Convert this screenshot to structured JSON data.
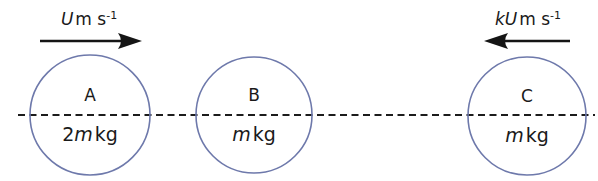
{
  "diagram": {
    "type": "physics-collision-diagram",
    "background_color": "#ffffff",
    "circle_stroke_color": "#6e79ab",
    "line_color": "#1c1c1c",
    "arrow_color": "#151515",
    "axis": {
      "style": "dashed",
      "y": 115,
      "x_start": 18,
      "x_end": 595
    },
    "bodies": [
      {
        "id": "A",
        "label": "A",
        "mass_prefix": "2",
        "mass_symbol": "m",
        "mass_unit": "kg",
        "mass_text": "2m kg",
        "cx": 90,
        "cy": 115,
        "r": 60
      },
      {
        "id": "B",
        "label": "B",
        "mass_prefix": "",
        "mass_symbol": "m",
        "mass_unit": "kg",
        "mass_text": "m kg",
        "cx": 254,
        "cy": 115,
        "r": 58
      },
      {
        "id": "C",
        "label": "C",
        "mass_prefix": "",
        "mass_symbol": "m",
        "mass_unit": "kg",
        "mass_text": "m kg",
        "cx": 527,
        "cy": 116,
        "r": 59
      }
    ],
    "velocity_arrows": [
      {
        "id": "velocity-A",
        "for_body": "A",
        "direction": "right",
        "symbol": "U",
        "unit": "m s",
        "exponent": "-1",
        "label_text": "U m s⁻¹",
        "label_x": 89,
        "label_y": 25,
        "shaft_y": 41,
        "shaft_x_start": 40,
        "shaft_x_end": 126,
        "tip_x": 142
      },
      {
        "id": "velocity-C",
        "for_body": "C",
        "direction": "left",
        "symbol": "kU",
        "unit": "m s",
        "exponent": "-1",
        "label_text": "kU m s⁻¹",
        "label_x": 528,
        "label_y": 25,
        "shaft_y": 41,
        "shaft_x_start": 570,
        "shaft_x_end": 500,
        "tip_x": 484
      }
    ]
  }
}
